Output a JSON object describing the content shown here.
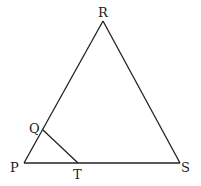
{
  "diagram": {
    "type": "triangle",
    "vertices": {
      "P": {
        "label": "P",
        "x": 24,
        "y": 163
      },
      "R": {
        "label": "R",
        "x": 103,
        "y": 21
      },
      "S": {
        "label": "S",
        "x": 180,
        "y": 163
      },
      "Q": {
        "label": "Q",
        "x": 43,
        "y": 130
      },
      "T": {
        "label": "T",
        "x": 78,
        "y": 163
      }
    },
    "segments": [
      [
        "P",
        "R"
      ],
      [
        "R",
        "S"
      ],
      [
        "P",
        "S"
      ],
      [
        "Q",
        "T"
      ]
    ]
  }
}
